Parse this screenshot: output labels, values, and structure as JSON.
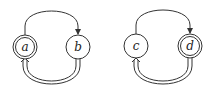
{
  "diagrams": [
    {
      "nodes": [
        {
          "id": "a",
          "label": "a",
          "accepting": true
        },
        {
          "id": "b",
          "label": "b",
          "accepting": false
        }
      ],
      "edges": [
        {
          "from": "a",
          "to": "b",
          "style": "single",
          "route": "top"
        },
        {
          "from": "b",
          "to": "a",
          "style": "double",
          "route": "bottom"
        }
      ]
    },
    {
      "nodes": [
        {
          "id": "c",
          "label": "c",
          "accepting": false
        },
        {
          "id": "d",
          "label": "d",
          "accepting": true
        }
      ],
      "edges": [
        {
          "from": "c",
          "to": "d",
          "style": "single",
          "route": "top"
        },
        {
          "from": "d",
          "to": "c",
          "style": "double",
          "route": "bottom"
        }
      ]
    }
  ],
  "colors": {
    "line": "#333333",
    "background": "#ffffff"
  }
}
